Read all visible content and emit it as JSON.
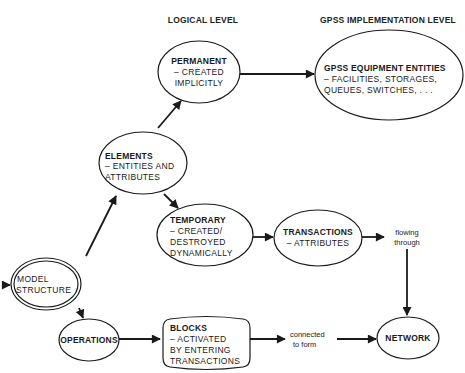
{
  "headers": {
    "logical": "LOGICAL LEVEL",
    "implementation": "GPSS IMPLEMENTATION LEVEL"
  },
  "nodes": {
    "permanent": {
      "title": "PERMANENT",
      "lines": [
        "– CREATED",
        "IMPLICITLY"
      ]
    },
    "equipment": {
      "title": "GPSS EQUIPMENT ENTITIES",
      "lines": [
        "– FACILITIES, STORAGES,",
        "QUEUES, SWITCHES, . . ."
      ]
    },
    "elements": {
      "title": "ELEMENTS",
      "lines": [
        "– ENTITIES AND",
        "ATTRIBUTES"
      ]
    },
    "temporary": {
      "title": "TEMPORARY",
      "lines": [
        "– CREATED/",
        "DESTROYED",
        "DYNAMICALLY"
      ]
    },
    "transactions": {
      "title": "TRANSACTIONS",
      "lines": [
        "– ATTRIBUTES"
      ]
    },
    "model_structure": {
      "lines": [
        "MODEL",
        "STRUCTURE"
      ]
    },
    "operations": {
      "title": "OPERATIONS"
    },
    "blocks": {
      "title": "BLOCKS",
      "lines": [
        "– ACTIVATED",
        "BY ENTERING",
        "TRANSACTIONS"
      ]
    },
    "network": {
      "title": "NETWORK"
    }
  },
  "edge_labels": {
    "flowing_through": [
      "flowing",
      "through"
    ],
    "connected_to_form": [
      "connected",
      "to form"
    ]
  },
  "edges": [
    {
      "from": "input",
      "to": "model_structure"
    },
    {
      "from": "model_structure",
      "to": "elements"
    },
    {
      "from": "model_structure",
      "to": "operations"
    },
    {
      "from": "elements",
      "to": "permanent"
    },
    {
      "from": "elements",
      "to": "temporary"
    },
    {
      "from": "permanent",
      "to": "equipment"
    },
    {
      "from": "temporary",
      "to": "transactions"
    },
    {
      "from": "transactions",
      "to": "network",
      "label": "flowing through"
    },
    {
      "from": "operations",
      "to": "blocks"
    },
    {
      "from": "blocks",
      "to": "network",
      "label": "connected to form"
    }
  ]
}
